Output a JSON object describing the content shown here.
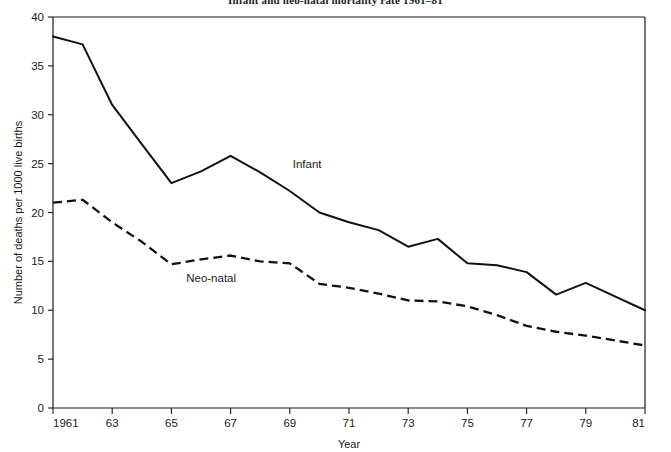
{
  "chart_data": {
    "type": "line",
    "title": "Infant and neo-natal mortality rate 1961–81",
    "xlabel": "Year",
    "ylabel": "Number of deaths per 1000 live births",
    "grid": false,
    "legend_position": "inline-annotation",
    "x": [
      1961,
      1962,
      1963,
      1964,
      1965,
      1966,
      1967,
      1968,
      1969,
      1970,
      1971,
      1972,
      1973,
      1974,
      1975,
      1976,
      1977,
      1978,
      1979,
      1980,
      1981
    ],
    "xlim": [
      1961,
      1981
    ],
    "ylim": [
      0,
      40
    ],
    "xticks": [
      1961,
      1963,
      1965,
      1967,
      1969,
      1971,
      1973,
      1975,
      1977,
      1979,
      1981
    ],
    "xtick_labels": [
      "1961",
      "63",
      "65",
      "67",
      "69",
      "71",
      "73",
      "75",
      "77",
      "79",
      "81"
    ],
    "yticks": [
      0,
      5,
      10,
      15,
      20,
      25,
      30,
      35,
      40
    ],
    "ytick_labels": [
      "0",
      "5",
      "10",
      "15",
      "20",
      "25",
      "30",
      "35",
      "40"
    ],
    "series": [
      {
        "name": "Infant",
        "style": "solid",
        "color": "#111111",
        "label_x": 1969.1,
        "label_y": 24.6,
        "values": [
          38.0,
          37.2,
          31.0,
          27.0,
          23.0,
          24.2,
          25.8,
          24.1,
          22.2,
          20.0,
          19.0,
          18.2,
          16.5,
          17.3,
          14.8,
          14.6,
          13.9,
          11.6,
          12.8,
          11.4,
          10.0
        ]
      },
      {
        "name": "Neo-natal",
        "style": "dashed",
        "color": "#111111",
        "label_x": 1965.5,
        "label_y": 12.9,
        "values": [
          21.0,
          21.3,
          19.0,
          17.0,
          14.7,
          15.2,
          15.6,
          15.0,
          14.8,
          12.7,
          12.3,
          11.7,
          11.0,
          10.9,
          10.4,
          9.5,
          8.4,
          7.8,
          7.4,
          6.9,
          6.4
        ]
      }
    ]
  }
}
